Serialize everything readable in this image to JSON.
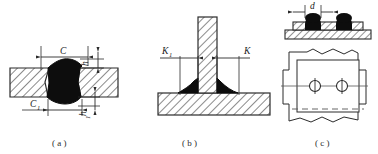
{
  "figure": {
    "colors": {
      "line": "#2b2b2b",
      "weld_fill": "#0d0d0d",
      "hatch": "#2b2b2b",
      "background": "#ffffff",
      "centerline": "#555555"
    },
    "panels": [
      {
        "id": "a",
        "caption": "( a )",
        "type": "butt-weld-cross-section",
        "labels": {
          "width_top": "C",
          "width_bottom": "C",
          "width_bottom_sub": "1",
          "height_top": "h",
          "height_bottom": "h",
          "height_bottom_sub": "1"
        }
      },
      {
        "id": "b",
        "caption": "( b )",
        "type": "tee-fillet-weld",
        "labels": {
          "leg_left": "K",
          "leg_left_sub": "1",
          "leg_right": "K"
        }
      },
      {
        "id": "c",
        "caption": "( c )",
        "type": "spot-weld-section-and-plan",
        "labels": {
          "nugget_diameter": "d"
        }
      }
    ]
  }
}
